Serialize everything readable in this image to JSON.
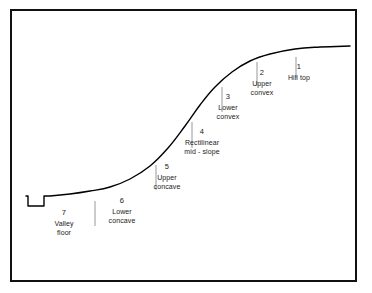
{
  "figure": {
    "frame_color": "#111111",
    "curve_color": "#000000",
    "tick_color": "#999999",
    "text_color": "#1a1a1a",
    "background": "#ffffff"
  },
  "segments": [
    {
      "number": "1",
      "line1": "Hill top",
      "line2": "",
      "label_x": 299,
      "label_y": 62,
      "tick_x": 296,
      "tick_y1": 57,
      "tick_y2": 78
    },
    {
      "number": "2",
      "line1": "Upper",
      "line2": "convex",
      "label_x": 262,
      "label_y": 68,
      "tick_x": 257,
      "tick_y1": 62,
      "tick_y2": 86
    },
    {
      "number": "3",
      "line1": "Lower",
      "line2": "convex",
      "label_x": 228,
      "label_y": 92,
      "tick_x": 222,
      "tick_y1": 87,
      "tick_y2": 112
    },
    {
      "number": "4",
      "line1": "Rectilinear",
      "line2": "mid - slope",
      "label_x": 202,
      "label_y": 127,
      "tick_x": 192,
      "tick_y1": 122,
      "tick_y2": 148
    },
    {
      "number": "5",
      "line1": "Upper",
      "line2": "concave",
      "label_x": 167,
      "label_y": 162,
      "tick_x": 156,
      "tick_y1": 165,
      "tick_y2": 190
    },
    {
      "number": "6",
      "line1": "Lower",
      "line2": "concave",
      "label_x": 122,
      "label_y": 196,
      "tick_x": 95,
      "tick_y1": 201,
      "tick_y2": 226
    },
    {
      "number": "7",
      "line1": "Valley",
      "line2": "floor",
      "label_x": 64,
      "label_y": 208,
      "tick_x": null,
      "tick_y1": null,
      "tick_y2": null
    }
  ],
  "curve": {
    "type": "hillslope-profile",
    "description": "Sigmoid slope profile rising left to right from valley floor to hill top",
    "valley_floor_y": 196,
    "hill_top_y": 47,
    "channel_notch": {
      "x1": 28,
      "x2": 50,
      "depth_y": 206
    },
    "path_points": [
      [
        26,
        196
      ],
      [
        28,
        196
      ],
      [
        28,
        206
      ],
      [
        44,
        206
      ],
      [
        44,
        196
      ],
      [
        50,
        196
      ],
      [
        70,
        194
      ],
      [
        90,
        191
      ],
      [
        110,
        187
      ],
      [
        130,
        179
      ],
      [
        150,
        166
      ],
      [
        168,
        148
      ],
      [
        185,
        126
      ],
      [
        200,
        105
      ],
      [
        215,
        87
      ],
      [
        232,
        72
      ],
      [
        250,
        61
      ],
      [
        270,
        54
      ],
      [
        295,
        49
      ],
      [
        320,
        47
      ],
      [
        350,
        46
      ]
    ]
  }
}
